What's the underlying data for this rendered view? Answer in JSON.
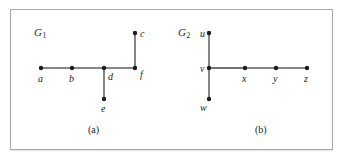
{
  "figure": {
    "background_color": "#ffffff",
    "frame_color": "#a9a9a9",
    "ink_color": "#1c1c1c",
    "edge_color": "#444444"
  },
  "panels": [
    {
      "id": "panel-a",
      "graph_label": "G",
      "graph_subscript": "1",
      "caption": "(a)",
      "caption_x": 88,
      "caption_y": 124,
      "label_x": 34,
      "label_y": 26,
      "vertices": [
        {
          "name": "a",
          "cx": 41,
          "cy": 68,
          "label": "a",
          "label_x": 38,
          "label_y": 74
        },
        {
          "name": "b",
          "cx": 72,
          "cy": 68,
          "label": "b",
          "label_x": 69,
          "label_y": 74
        },
        {
          "name": "d",
          "cx": 104,
          "cy": 68,
          "label": "d",
          "label_x": 108,
          "label_y": 72
        },
        {
          "name": "f",
          "cx": 135,
          "cy": 68,
          "label": "f",
          "label_x": 140,
          "label_y": 70
        },
        {
          "name": "c",
          "cx": 135,
          "cy": 33,
          "label": "c",
          "label_x": 140,
          "label_y": 29
        },
        {
          "name": "e",
          "cx": 104,
          "cy": 99,
          "label": "e",
          "label_x": 101,
          "label_y": 104
        }
      ],
      "edges": [
        {
          "from": "a",
          "to": "b"
        },
        {
          "from": "b",
          "to": "d"
        },
        {
          "from": "d",
          "to": "f"
        },
        {
          "from": "f",
          "to": "c"
        },
        {
          "from": "d",
          "to": "e"
        }
      ]
    },
    {
      "id": "panel-b",
      "graph_label": "G",
      "graph_subscript": "2",
      "caption": "(b)",
      "caption_x": 255,
      "caption_y": 124,
      "label_x": 178,
      "label_y": 26,
      "vertices": [
        {
          "name": "u",
          "cx": 209,
          "cy": 33,
          "label": "u",
          "label_x": 200,
          "label_y": 29
        },
        {
          "name": "v",
          "cx": 209,
          "cy": 68,
          "label": "v",
          "label_x": 200,
          "label_y": 64
        },
        {
          "name": "w",
          "cx": 209,
          "cy": 99,
          "label": "w",
          "label_x": 200,
          "label_y": 103
        },
        {
          "name": "x",
          "cx": 245,
          "cy": 68,
          "label": "x",
          "label_x": 242,
          "label_y": 74
        },
        {
          "name": "y",
          "cx": 276,
          "cy": 68,
          "label": "y",
          "label_x": 273,
          "label_y": 74
        },
        {
          "name": "z",
          "cx": 307,
          "cy": 68,
          "label": "z",
          "label_x": 304,
          "label_y": 74
        }
      ],
      "edges": [
        {
          "from": "u",
          "to": "v"
        },
        {
          "from": "v",
          "to": "w"
        },
        {
          "from": "v",
          "to": "x"
        },
        {
          "from": "x",
          "to": "y"
        },
        {
          "from": "y",
          "to": "z"
        }
      ]
    }
  ],
  "chart_data": {
    "type": "diagram",
    "title": "",
    "graphs": [
      {
        "name": "G1",
        "caption": "(a)",
        "vertices": [
          "a",
          "b",
          "c",
          "d",
          "e",
          "f"
        ],
        "edges": [
          [
            "a",
            "b"
          ],
          [
            "b",
            "d"
          ],
          [
            "d",
            "f"
          ],
          [
            "f",
            "c"
          ],
          [
            "d",
            "e"
          ]
        ],
        "degrees": {
          "a": 1,
          "b": 2,
          "c": 1,
          "d": 3,
          "e": 1,
          "f": 2
        }
      },
      {
        "name": "G2",
        "caption": "(b)",
        "vertices": [
          "u",
          "v",
          "w",
          "x",
          "y",
          "z"
        ],
        "edges": [
          [
            "u",
            "v"
          ],
          [
            "v",
            "w"
          ],
          [
            "v",
            "x"
          ],
          [
            "x",
            "y"
          ],
          [
            "y",
            "z"
          ]
        ],
        "degrees": {
          "u": 1,
          "v": 3,
          "w": 1,
          "x": 2,
          "y": 2,
          "z": 1
        }
      }
    ]
  }
}
